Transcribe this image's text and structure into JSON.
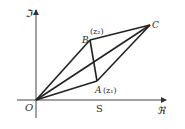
{
  "diagram": {
    "axes": {
      "y_label": "ℑ",
      "x_label": "ℜ",
      "origin_label": "O",
      "x_tick_label": "S"
    },
    "points": {
      "O": {
        "label": "O",
        "x": 36,
        "y": 100
      },
      "A": {
        "label": "A",
        "sub_label": "(z₁)",
        "x": 97,
        "y": 81
      },
      "B": {
        "label": "B",
        "sub_label": "(z₂)",
        "x": 90,
        "y": 40
      },
      "C": {
        "label": "C",
        "x": 150,
        "y": 25
      }
    },
    "segments": [
      [
        "O",
        "A"
      ],
      [
        "O",
        "B"
      ],
      [
        "O",
        "C"
      ],
      [
        "A",
        "C"
      ],
      [
        "B",
        "C"
      ],
      [
        "B",
        "A"
      ]
    ],
    "colors": {
      "stroke": "#222222",
      "axis": "#444444",
      "text": "#2a2a2a"
    }
  }
}
